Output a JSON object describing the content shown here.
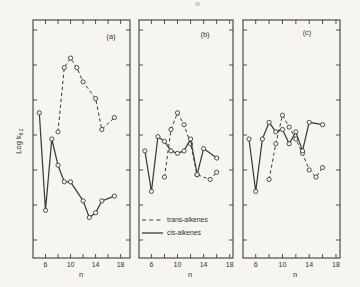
{
  "figure": {
    "bg": "#f6f5f2",
    "line_color": "#3e3d39",
    "text_color": "#33322f",
    "ylabel_main": "Log k",
    "ylabel_sub": "6 2",
    "xlabel": "n",
    "x_tick_labels": [
      "6",
      "10",
      "14",
      "18"
    ],
    "legend": [
      {
        "style": "dashed",
        "label": "trans-alkenes"
      },
      {
        "style": "solid",
        "label": "cis-alkenes"
      }
    ]
  },
  "chart_data": [
    {
      "type": "line",
      "title": "(a)",
      "xlabel": "n",
      "ylabel": "Log k6 2",
      "xlim": [
        4,
        19.5
      ],
      "ylim": [
        0,
        10
      ],
      "x_ticks": [
        6,
        8,
        10,
        12,
        14,
        16,
        18
      ],
      "x_tick_labeled": [
        6,
        10,
        14,
        18
      ],
      "grid": false,
      "series": [
        {
          "name": "trans-alkenes",
          "style": "dashed",
          "x": [
            8,
            9,
            10,
            11,
            12,
            14,
            15,
            17
          ],
          "y": [
            5.3,
            8.0,
            8.4,
            8.0,
            7.4,
            6.7,
            5.4,
            5.9
          ]
        },
        {
          "name": "cis-alkenes",
          "style": "solid",
          "x": [
            5,
            6,
            7,
            8,
            9,
            10,
            12,
            13,
            14,
            15,
            17
          ],
          "y": [
            6.1,
            2.0,
            5.0,
            3.9,
            3.2,
            3.2,
            2.4,
            1.7,
            1.9,
            2.4,
            2.6
          ]
        }
      ]
    },
    {
      "type": "line",
      "title": "(b)",
      "xlabel": "n",
      "ylabel": "Log k6 2",
      "xlim": [
        4.1,
        18.5
      ],
      "ylim": [
        0,
        10
      ],
      "x_ticks": [
        6,
        8,
        10,
        12,
        14,
        16,
        18
      ],
      "x_tick_labeled": [
        6,
        10,
        14,
        18
      ],
      "grid": false,
      "series": [
        {
          "name": "trans-alkenes",
          "style": "dashed",
          "x": [
            8,
            9,
            10,
            11,
            12,
            13,
            15,
            16
          ],
          "y": [
            3.4,
            5.4,
            6.1,
            5.6,
            4.8,
            3.5,
            3.3,
            3.6
          ]
        },
        {
          "name": "cis-alkenes",
          "style": "solid",
          "x": [
            5,
            6,
            7,
            8,
            9,
            10,
            11,
            12,
            13,
            14,
            16
          ],
          "y": [
            4.5,
            2.8,
            5.1,
            4.9,
            4.5,
            4.4,
            4.5,
            5.0,
            3.5,
            4.6,
            4.2
          ]
        }
      ]
    },
    {
      "type": "line",
      "title": "(c)",
      "xlabel": "n",
      "ylabel": "Log k6 2",
      "xlim": [
        4.1,
        18.6
      ],
      "ylim": [
        0,
        10
      ],
      "x_ticks": [
        6,
        8,
        10,
        12,
        14,
        16,
        18
      ],
      "x_tick_labeled": [
        6,
        10,
        14,
        18
      ],
      "grid": false,
      "series": [
        {
          "name": "trans-alkenes",
          "style": "dashed",
          "x": [
            8,
            9,
            10,
            11,
            12,
            13,
            14,
            15,
            16
          ],
          "y": [
            3.3,
            4.8,
            6.0,
            5.5,
            5.0,
            4.4,
            3.7,
            3.4,
            3.8
          ]
        },
        {
          "name": "cis-alkenes",
          "style": "solid",
          "x": [
            5,
            6,
            7,
            8,
            9,
            10,
            11,
            12,
            13,
            14,
            16
          ],
          "y": [
            5.0,
            2.8,
            5.0,
            5.7,
            5.3,
            5.4,
            4.8,
            5.3,
            4.5,
            5.7,
            5.6
          ]
        }
      ]
    }
  ]
}
